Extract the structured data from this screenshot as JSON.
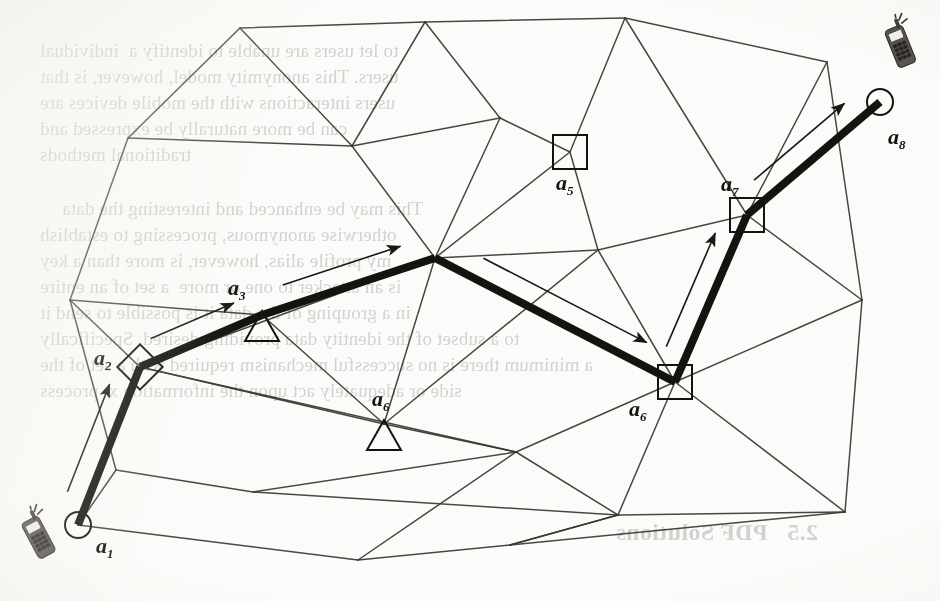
{
  "figure": {
    "type": "graph-path-diagram",
    "paper_color": "#fbfbf9",
    "ink_color": "#15130f",
    "mesh_color": "#3a3733",
    "bleed_color": "#8e8a86"
  },
  "nodes": [
    {
      "id": "a1",
      "label": "a",
      "sub": "1",
      "shape": "circle",
      "x": 78,
      "y": 525,
      "on_path": true,
      "label_dx": 18,
      "label_dy": 8,
      "has_phone": true,
      "phone_x": 22,
      "phone_y": 505,
      "phone_rot": -28
    },
    {
      "id": "a2",
      "label": "a",
      "sub": "2",
      "shape": "diamond",
      "x": 140,
      "y": 367,
      "on_path": true,
      "label_dx": -46,
      "label_dy": -22,
      "has_phone": false
    },
    {
      "id": "a3",
      "label": "a",
      "sub": "3",
      "shape": "triangle",
      "x": 262,
      "y": 315,
      "on_path": true,
      "label_dx": -34,
      "label_dy": -40,
      "has_phone": false
    },
    {
      "id": "a4",
      "label": "",
      "sub": "",
      "shape": "vertex",
      "x": 435,
      "y": 258,
      "on_path": true,
      "label_dx": 0,
      "label_dy": 0,
      "has_phone": false
    },
    {
      "id": "a5",
      "label": "a",
      "sub": "5",
      "shape": "square",
      "x": 570,
      "y": 152,
      "on_path": false,
      "label_dx": -14,
      "label_dy": 18,
      "has_phone": false
    },
    {
      "id": "a6b",
      "label": "a",
      "sub": "6",
      "shape": "triangle",
      "x": 384,
      "y": 424,
      "on_path": false,
      "label_dx": -12,
      "label_dy": -38,
      "has_phone": false
    },
    {
      "id": "a6",
      "label": "a",
      "sub": "6",
      "shape": "square",
      "x": 675,
      "y": 382,
      "on_path": true,
      "label_dx": -46,
      "label_dy": 14,
      "has_phone": false
    },
    {
      "id": "a7",
      "label": "a",
      "sub": "7",
      "shape": "square",
      "x": 747,
      "y": 215,
      "on_path": true,
      "label_dx": -26,
      "label_dy": -44,
      "has_phone": false
    },
    {
      "id": "a8",
      "label": "a",
      "sub": "8",
      "shape": "circle",
      "x": 880,
      "y": 102,
      "on_path": true,
      "label_dx": 8,
      "label_dy": 22,
      "has_phone": true,
      "phone_x": 884,
      "phone_y": 14,
      "phone_rot": -22
    }
  ],
  "path": {
    "sequence": [
      "a1",
      "a2",
      "a3",
      "a4",
      "a6",
      "a7",
      "a8"
    ],
    "stroke_width": 8,
    "arrow_offset": 22,
    "segments": [
      {
        "from": "a1",
        "to": "a2"
      },
      {
        "from": "a2",
        "to": "a3"
      },
      {
        "from": "a3",
        "to": "a4"
      },
      {
        "from": "a4",
        "to": "a6"
      },
      {
        "from": "a6",
        "to": "a7"
      },
      {
        "from": "a7",
        "to": "a8"
      }
    ]
  },
  "mesh": {
    "vertices": [
      [
        240,
        28
      ],
      [
        425,
        22
      ],
      [
        625,
        18
      ],
      [
        827,
        62
      ],
      [
        128,
        138
      ],
      [
        352,
        146
      ],
      [
        500,
        118
      ],
      [
        570,
        152
      ],
      [
        70,
        300
      ],
      [
        140,
        367
      ],
      [
        262,
        315
      ],
      [
        435,
        258
      ],
      [
        598,
        250
      ],
      [
        747,
        215
      ],
      [
        880,
        102
      ],
      [
        116,
        470
      ],
      [
        253,
        492
      ],
      [
        384,
        424
      ],
      [
        516,
        452
      ],
      [
        675,
        382
      ],
      [
        862,
        300
      ],
      [
        618,
        515
      ],
      [
        845,
        512
      ],
      [
        358,
        560
      ],
      [
        510,
        545
      ],
      [
        78,
        525
      ]
    ],
    "edges": [
      [
        0,
        1
      ],
      [
        1,
        2
      ],
      [
        2,
        3
      ],
      [
        0,
        4
      ],
      [
        4,
        8
      ],
      [
        8,
        15
      ],
      [
        15,
        25
      ],
      [
        25,
        23
      ],
      [
        23,
        24
      ],
      [
        24,
        21
      ],
      [
        21,
        22
      ],
      [
        22,
        20
      ],
      [
        20,
        3
      ],
      [
        0,
        5
      ],
      [
        1,
        5
      ],
      [
        1,
        6
      ],
      [
        5,
        6
      ],
      [
        5,
        11
      ],
      [
        6,
        7
      ],
      [
        2,
        7
      ],
      [
        6,
        11
      ],
      [
        7,
        11
      ],
      [
        7,
        12
      ],
      [
        2,
        13
      ],
      [
        12,
        13
      ],
      [
        13,
        3
      ],
      [
        4,
        5
      ],
      [
        8,
        10
      ],
      [
        10,
        11
      ],
      [
        9,
        10
      ],
      [
        9,
        11
      ],
      [
        9,
        25
      ],
      [
        8,
        9
      ],
      [
        11,
        12
      ],
      [
        11,
        17
      ],
      [
        12,
        19
      ],
      [
        19,
        13
      ],
      [
        19,
        20
      ],
      [
        13,
        20
      ],
      [
        9,
        17
      ],
      [
        9,
        18
      ],
      [
        17,
        18
      ],
      [
        16,
        18
      ],
      [
        15,
        16
      ],
      [
        16,
        21
      ],
      [
        18,
        19
      ],
      [
        18,
        21
      ],
      [
        19,
        21
      ],
      [
        19,
        22
      ],
      [
        23,
        18
      ],
      [
        21,
        24
      ],
      [
        24,
        22
      ],
      [
        17,
        10
      ],
      [
        12,
        17
      ]
    ]
  },
  "bleed_text": {
    "lines": [
      {
        "text": "to let users are unable to identify a  individual",
        "x": 40,
        "y": 38,
        "size": 19
      },
      {
        "text": "users. This anonymity model, however, is that",
        "x": 40,
        "y": 64,
        "size": 19
      },
      {
        "text": "users interactions with the mobile devices are",
        "x": 40,
        "y": 90,
        "size": 19
      },
      {
        "text": "can be more naturally be expressed and",
        "x": 40,
        "y": 116,
        "size": 19
      },
      {
        "text": "traditional methods",
        "x": 40,
        "y": 142,
        "size": 19
      },
      {
        "text": "This may be enhanced and interesting the data",
        "x": 62,
        "y": 196,
        "size": 19
      },
      {
        "text": "otherwise anonymous, processing to establish",
        "x": 40,
        "y": 222,
        "size": 19
      },
      {
        "text": "my profile alias, however, is more than a key",
        "x": 40,
        "y": 248,
        "size": 19
      },
      {
        "text": "is an attacker to one or more  a set of an entire",
        "x": 40,
        "y": 274,
        "size": 19
      },
      {
        "text": "in a grouping of the data it is possible to send it",
        "x": 40,
        "y": 300,
        "size": 19
      },
      {
        "text": "to a subset of the identity data providing desired. Specifically",
        "x": 40,
        "y": 326,
        "size": 19
      },
      {
        "text": "a minimum there is no successful mechanism required with a set of the",
        "x": 40,
        "y": 352,
        "size": 19
      },
      {
        "text": "side or adequately act upon the information x  process",
        "x": 40,
        "y": 378,
        "size": 19
      },
      {
        "text": "2.5   PDF Solutions",
        "x": 616,
        "y": 520,
        "size": 24,
        "head": true
      }
    ]
  },
  "labels_note": "Figure labels a1..a8 mark waypoints of the highlighted route"
}
